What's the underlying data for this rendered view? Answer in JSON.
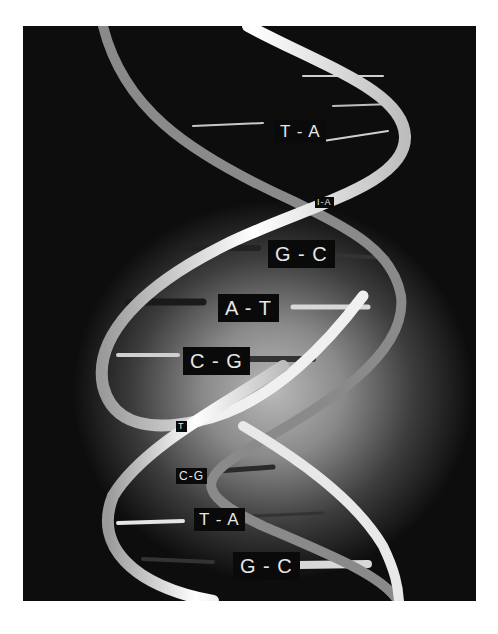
{
  "image": {
    "subject": "DNA double helix",
    "background_color": "#0d0d0d",
    "backbone_color": "#f2f2f2",
    "label_bg": "#0a0a0a",
    "label_fg": "#e6e6e6"
  },
  "base_pairs": [
    {
      "label": "T-A"
    },
    {
      "label": "T-A"
    },
    {
      "label": "G-C"
    },
    {
      "label": "A-T"
    },
    {
      "label": "C-G"
    },
    {
      "label": "T-A"
    },
    {
      "label": "C-G"
    },
    {
      "label": "T-A"
    },
    {
      "label": "G-C"
    }
  ],
  "labels_display": [
    "T - A",
    "I-A",
    "G - C",
    "A - T",
    "C - G",
    "T",
    "C-G",
    "T - A",
    "G - C"
  ]
}
